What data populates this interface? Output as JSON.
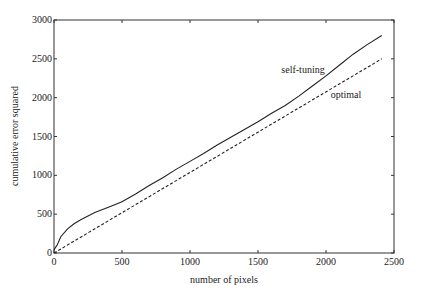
{
  "chart_data": {
    "type": "line",
    "title": "",
    "xlabel": "number of pixels",
    "ylabel": "cumulative error squared",
    "xlim": [
      0,
      2500
    ],
    "ylim": [
      0,
      3000
    ],
    "xticks": [
      0,
      500,
      1000,
      1500,
      2000,
      2500
    ],
    "yticks": [
      0,
      500,
      1000,
      1500,
      2000,
      2500,
      3000
    ],
    "grid": false,
    "legend": "inline annotations",
    "annotations": [
      {
        "text": "self-tuning",
        "x": 1750,
        "y": 2450
      },
      {
        "text": "optimal",
        "x": 2050,
        "y": 2050
      }
    ],
    "series": [
      {
        "name": "self-tuning",
        "style": "solid",
        "x": [
          0,
          25,
          50,
          100,
          150,
          200,
          300,
          400,
          500,
          600,
          700,
          800,
          900,
          1000,
          1100,
          1200,
          1300,
          1400,
          1500,
          1600,
          1700,
          1800,
          1900,
          2000,
          2100,
          2200,
          2300,
          2410
        ],
        "values": [
          40,
          110,
          210,
          310,
          380,
          430,
          520,
          590,
          660,
          760,
          870,
          970,
          1080,
          1180,
          1280,
          1390,
          1490,
          1590,
          1690,
          1800,
          1900,
          2020,
          2150,
          2280,
          2420,
          2560,
          2680,
          2800
        ]
      },
      {
        "name": "optimal",
        "style": "dashed",
        "x": [
          0,
          2410
        ],
        "values": [
          0,
          2500
        ]
      }
    ]
  }
}
